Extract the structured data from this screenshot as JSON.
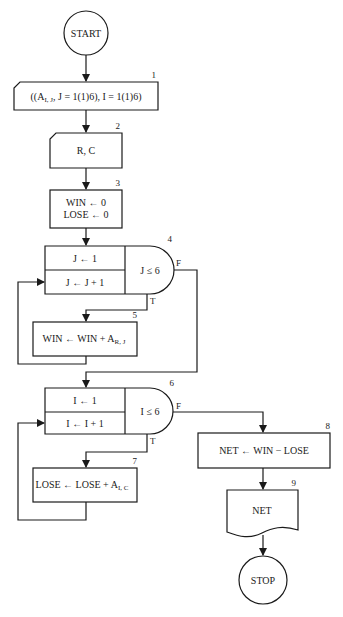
{
  "diagram": {
    "type": "flowchart",
    "nodes": [
      {
        "id": "start",
        "shape": "terminal",
        "label": "START"
      },
      {
        "id": "1",
        "number": "1",
        "shape": "card-input",
        "label_main": "((A",
        "label_sub": "I, J",
        "label_rest": ", J = 1(1)6), I = 1(1)6)"
      },
      {
        "id": "2",
        "number": "2",
        "shape": "card-input",
        "label": "R, C"
      },
      {
        "id": "3",
        "number": "3",
        "shape": "process",
        "lines": [
          "WIN ← 0",
          "LOSE ← 0"
        ]
      },
      {
        "id": "4",
        "number": "4",
        "shape": "loop",
        "init": "J ← 1",
        "incr": "J ← J + 1",
        "test": "J ≤ 6",
        "true_label": "T",
        "false_label": "F"
      },
      {
        "id": "5",
        "number": "5",
        "shape": "process",
        "label_main": "WIN ← WIN + A",
        "label_sub": "R, J"
      },
      {
        "id": "6",
        "number": "6",
        "shape": "loop",
        "init": "I ← 1",
        "incr": "I ← I + 1",
        "test": "I ≤ 6",
        "true_label": "T",
        "false_label": "F"
      },
      {
        "id": "7",
        "number": "7",
        "shape": "process",
        "label_main": "LOSE ← LOSE + A",
        "label_sub": "I, C"
      },
      {
        "id": "8",
        "number": "8",
        "shape": "process",
        "label": "NET ← WIN − LOSE"
      },
      {
        "id": "9",
        "number": "9",
        "shape": "document-output",
        "label": "NET"
      },
      {
        "id": "stop",
        "shape": "terminal",
        "label": "STOP"
      }
    ],
    "edges": [
      {
        "from": "start",
        "to": "1"
      },
      {
        "from": "1",
        "to": "2"
      },
      {
        "from": "2",
        "to": "3"
      },
      {
        "from": "3",
        "to": "4"
      },
      {
        "from": "4",
        "to": "5",
        "label": "T"
      },
      {
        "from": "5",
        "to": "4",
        "note": "loop back to increment"
      },
      {
        "from": "4",
        "to": "6",
        "label": "F"
      },
      {
        "from": "6",
        "to": "7",
        "label": "T"
      },
      {
        "from": "7",
        "to": "6",
        "note": "loop back to increment"
      },
      {
        "from": "6",
        "to": "8",
        "label": "F"
      },
      {
        "from": "8",
        "to": "9"
      },
      {
        "from": "9",
        "to": "stop"
      }
    ]
  }
}
